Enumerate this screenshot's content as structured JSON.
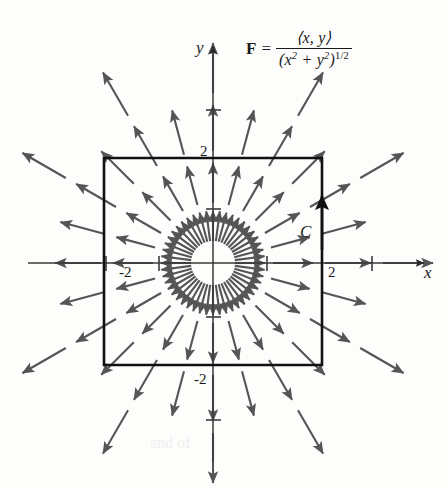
{
  "figure": {
    "title_formula": {
      "symbol": "F",
      "equals": "=",
      "numerator": "⟨x, y⟩",
      "denominator_base": "(x",
      "denominator_mid": " + y",
      "denominator_tail": ")",
      "exp2_a": "2",
      "exp2_b": "2",
      "exp_outer": "1/2",
      "plus": "+",
      "full_text": "F = ⟨x, y⟩ / (x² + y²)^(1/2)"
    },
    "axes": {
      "x_label": "x",
      "y_label": "y",
      "x_tick_labels": [
        "-2",
        "2"
      ],
      "y_tick_labels": [
        "2",
        "-2"
      ],
      "x_neg_2": "-2",
      "x_pos_2": "2",
      "y_pos_2": "2",
      "y_neg_2": "-2"
    },
    "curve": {
      "label": "C",
      "orientation": "counterclockwise"
    },
    "colors": {
      "arrow": "#555555",
      "axis": "#444444",
      "square": "#111111",
      "text": "#1a1a1a",
      "background": "#fdfdfc"
    },
    "bleed_through_text": "and of"
  },
  "chart_data": {
    "type": "scatter",
    "subtitle": "Radial unit vector field with square curve C",
    "xlabel": "x",
    "ylabel": "y",
    "xlim": [
      -4.6,
      4.6
    ],
    "ylim": [
      -4.6,
      4.6
    ],
    "grid": false,
    "legend": false,
    "field": {
      "kind": "radial-unit-vectors",
      "formula": "F(x,y) = (x, y) / sqrt(x^2 + y^2)",
      "magnitude": 1,
      "direction": "outward from origin",
      "n_rays": 48,
      "angle_step_deg": 7.5,
      "rings": [
        {
          "r_start": 22,
          "r_end": 52
        },
        {
          "r_start": 60,
          "r_end": 100
        },
        {
          "r_start": 112,
          "r_end": 158
        },
        {
          "r_start": 170,
          "r_end": 220
        }
      ],
      "singularity_radius_px": 22
    },
    "curve_C": {
      "shape": "square",
      "x_min": -2,
      "x_max": 2,
      "y_min": -2,
      "y_max": 2,
      "orientation": "counterclockwise",
      "label": "C"
    },
    "axis_ticks": {
      "x": [
        -4,
        -2,
        2,
        4
      ],
      "y": [
        -4,
        -2,
        2,
        4
      ],
      "labeled_x": [
        -2,
        2
      ],
      "labeled_y": [
        -2,
        2
      ]
    },
    "geometry_px": {
      "origin": [
        213,
        263
      ],
      "unit_px": 54,
      "square_px": {
        "left": 104,
        "top": 158,
        "right": 322,
        "bottom": 365
      }
    }
  }
}
